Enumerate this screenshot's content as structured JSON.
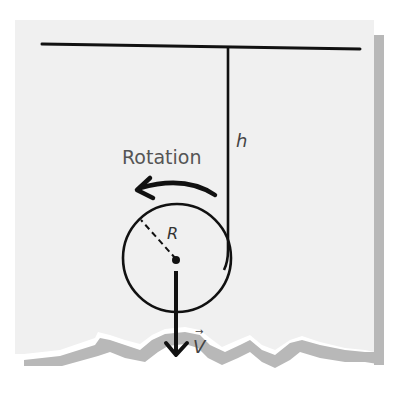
{
  "diagram": {
    "labels": {
      "height": "h",
      "rotation": "Rotation",
      "radius": "R",
      "velocity": "V",
      "velocity_arrow": "→"
    },
    "colors": {
      "paper": "#f0f0f0",
      "shadow": "#b8b8b8",
      "ink": "#111111",
      "label_ink": "#444444",
      "background": "#ffffff"
    },
    "elements": [
      {
        "name": "ceiling",
        "type": "line"
      },
      {
        "name": "string",
        "type": "line",
        "label": "h"
      },
      {
        "name": "disk",
        "type": "circle",
        "label": "R"
      },
      {
        "name": "rotation-arrow",
        "type": "curved-arrow",
        "label": "Rotation",
        "direction": "counterclockwise"
      },
      {
        "name": "velocity-arrow",
        "type": "arrow",
        "label": "V",
        "direction": "down"
      }
    ]
  }
}
